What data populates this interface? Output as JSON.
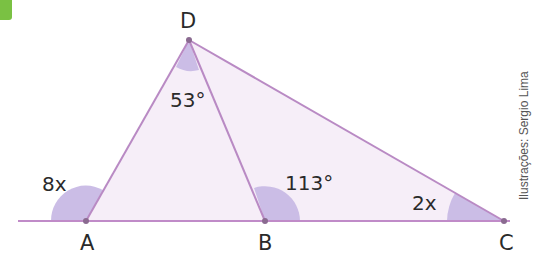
{
  "badge": {
    "color": "#7ac143"
  },
  "figure": {
    "fill_color": "#f6eef8",
    "line_color": "#c08bc8",
    "angle_fill": "#cbbde6",
    "points": {
      "A": {
        "label": "A",
        "x": 86,
        "y": 221
      },
      "B": {
        "label": "B",
        "x": 265,
        "y": 221
      },
      "C": {
        "label": "C",
        "x": 504,
        "y": 221
      },
      "D": {
        "label": "D",
        "x": 189,
        "y": 40
      }
    },
    "angles": {
      "D": "53°",
      "A_exterior": "8x",
      "B_exterior": "113°",
      "C": "2x"
    }
  },
  "credit": "Ilustrações: Sergio Lima"
}
